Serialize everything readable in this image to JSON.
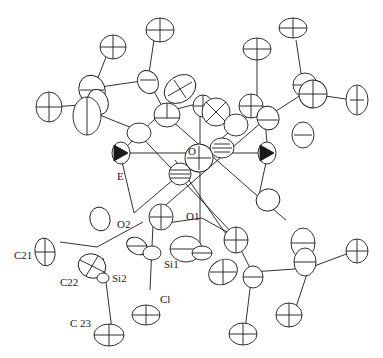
{
  "figure": {
    "type": "ORTEP thermal ellipsoid molecular structure",
    "colors": {
      "ink": "#1a1a1a",
      "background": "#ffffff"
    },
    "labels": [
      {
        "id": "E",
        "text": "E",
        "x": 117,
        "y": 176
      },
      {
        "id": "O",
        "text": "O",
        "x": 186,
        "y": 148
      },
      {
        "id": "O1",
        "text": "O1",
        "x": 186,
        "y": 204
      },
      {
        "id": "O2",
        "text": "O2",
        "x": 117,
        "y": 210
      },
      {
        "id": "Si1",
        "text": "Si1",
        "x": 164,
        "y": 259
      },
      {
        "id": "Si2",
        "text": "Si2",
        "x": 112,
        "y": 275
      },
      {
        "id": "C21",
        "text": "C21",
        "x": 15,
        "y": 253
      },
      {
        "id": "C22",
        "text": "C22",
        "x": 60,
        "y": 280
      },
      {
        "id": "Cl",
        "text": "Cl",
        "x": 159,
        "y": 296
      },
      {
        "id": "C23",
        "text": "C 23",
        "x": 70,
        "y": 314
      }
    ]
  }
}
